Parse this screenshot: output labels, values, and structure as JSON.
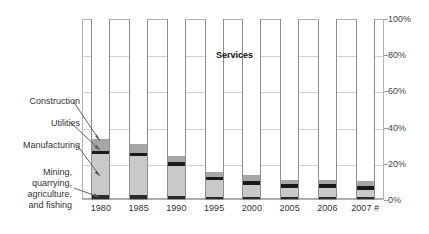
{
  "chart_data": {
    "type": "bar",
    "subtype": "stacked-100-percent",
    "title": "",
    "xlabel": "",
    "ylabel": "",
    "ylim": [
      0,
      100
    ],
    "yticks": [
      "0%",
      "20%",
      "40%",
      "60%",
      "80%",
      "100%"
    ],
    "ytick_values": [
      0,
      20,
      40,
      60,
      80,
      100
    ],
    "grid": true,
    "legend_position": "in-plot-callouts",
    "categories": [
      "1980",
      "1985",
      "1990",
      "1995",
      "2000",
      "2005",
      "2006",
      "2007 #"
    ],
    "series": [
      {
        "name": "Mining, quarrying, agriculture, and fishing",
        "color": "#2b2b2b",
        "values": [
          2.2,
          2.0,
          1.6,
          1.2,
          1.0,
          1.0,
          1.0,
          1.0
        ]
      },
      {
        "name": "Manufacturing",
        "color": "#c9c9c9",
        "values": [
          22.8,
          21.5,
          16.9,
          9.3,
          6.8,
          5.2,
          5.0,
          4.2
        ]
      },
      {
        "name": "Utilities",
        "color": "#1a1a1a",
        "values": [
          1.8,
          1.9,
          1.9,
          1.9,
          2.0,
          2.0,
          2.1,
          2.0
        ]
      },
      {
        "name": "Construction",
        "color": "#a6a6a6",
        "values": [
          6.2,
          5.1,
          3.1,
          2.4,
          3.4,
          2.3,
          2.4,
          2.8
        ]
      },
      {
        "name": "Services",
        "color": "#ffffff",
        "values": [
          67.0,
          69.5,
          76.5,
          85.2,
          86.8,
          89.5,
          89.5,
          90.0
        ]
      }
    ],
    "annotations": [
      {
        "name": "services-label",
        "text": "Services",
        "bold": true
      },
      {
        "name": "callout-construction",
        "text": "Construction"
      },
      {
        "name": "callout-utilities",
        "text": "Utilities"
      },
      {
        "name": "callout-manufacturing",
        "text": "Manufacturing"
      },
      {
        "name": "callout-mining",
        "text": "Mining, quarrying, agriculture, and fishing"
      }
    ]
  },
  "labels": {
    "services": "Services",
    "construction": "Construction",
    "utilities": "Utilities",
    "manufacturing": "Manufacturing",
    "mining_line1": "Mining,",
    "mining_line2": "quarrying,",
    "mining_line3": "agriculture,",
    "mining_line4": "and fishing"
  }
}
